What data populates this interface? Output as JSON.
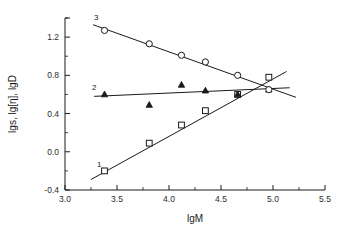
{
  "chart_data": {
    "type": "scatter",
    "title": "",
    "xlabel": "lgM",
    "ylabel": "lgs, lg[η], lgD",
    "xlim": [
      3.0,
      5.5
    ],
    "ylim": [
      -0.4,
      1.4
    ],
    "xticks": [
      "3.0",
      "3.5",
      "4.0",
      "4.5",
      "5.0",
      "5.5"
    ],
    "xtick_values": [
      3.0,
      3.5,
      4.0,
      4.5,
      5.0,
      5.5
    ],
    "yticks": [
      "-0.4",
      "0.0",
      "0.4",
      "0.8",
      "1.2"
    ],
    "ytick_values": [
      -0.4,
      0.0,
      0.4,
      0.8,
      1.2
    ],
    "minor_ticks": true,
    "grid": false,
    "legend": "inline-curve-numbers",
    "series": [
      {
        "name": "1",
        "label": "1",
        "marker": "open-square",
        "label_x": 3.33,
        "label_y": -0.16,
        "fit_from": [
          3.25,
          -0.29
        ],
        "fit_to": [
          5.13,
          0.84
        ],
        "x": [
          3.38,
          3.81,
          4.12,
          4.35,
          4.66,
          4.96
        ],
        "y": [
          -0.2,
          0.09,
          0.28,
          0.43,
          0.6,
          0.78
        ]
      },
      {
        "name": "2",
        "label": "2",
        "marker": "filled-triangle",
        "label_x": 3.28,
        "label_y": 0.65,
        "fit_from": [
          3.28,
          0.58
        ],
        "fit_to": [
          5.16,
          0.67
        ],
        "x": [
          3.38,
          3.81,
          4.12,
          4.35,
          4.66,
          4.96
        ],
        "y": [
          0.6,
          0.49,
          0.7,
          0.64,
          0.6,
          0.65
        ]
      },
      {
        "name": "3",
        "label": "3",
        "marker": "open-circle",
        "label_x": 3.3,
        "label_y": 1.38,
        "fit_from": [
          3.27,
          1.33
        ],
        "fit_to": [
          5.22,
          0.57
        ],
        "x": [
          3.38,
          3.81,
          4.12,
          4.35,
          4.66,
          4.96
        ],
        "y": [
          1.27,
          1.13,
          1.01,
          0.94,
          0.8,
          0.65
        ]
      }
    ]
  },
  "axes": {
    "x_title": "lgM",
    "y_title": "lgs, lg[η], lgD"
  }
}
